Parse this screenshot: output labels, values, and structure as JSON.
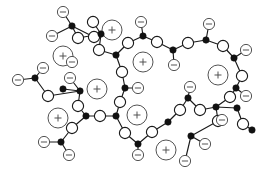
{
  "figure": {
    "canvas": {
      "width": 272,
      "height": 178,
      "background": "#ffffff"
    },
    "legend_semantics": {
      "junction": "filled black dot - crosslink / branch junction",
      "segment": "open white circle - polymer chain segment bead",
      "anion": "small circle with minus sign - pendant anionic group",
      "cation": "large circle with plus sign - free cationic counter-ion"
    },
    "colors": {
      "line": "#1a1a1a",
      "junction_fill": "#111111",
      "segment_fill": "#ffffff",
      "ion_stroke": "#4a4a4a",
      "background": "#ffffff"
    },
    "glyphs": {
      "anion_label": "−",
      "cation_label": "+"
    },
    "radii": {
      "junction": 3.2,
      "segment": 5.6,
      "anion": 5.6,
      "cation": 10.0
    }
  },
  "network_data": {
    "type": "node-link-diagram",
    "junctions": [
      {
        "id": "j1",
        "x": 72,
        "y": 26
      },
      {
        "id": "j2",
        "x": 101,
        "y": 34
      },
      {
        "id": "j3",
        "x": 116,
        "y": 55
      },
      {
        "id": "j4",
        "x": 143,
        "y": 36
      },
      {
        "id": "j5",
        "x": 173,
        "y": 50
      },
      {
        "id": "j6",
        "x": 206,
        "y": 40
      },
      {
        "id": "j7",
        "x": 234,
        "y": 58
      },
      {
        "id": "j8",
        "x": 236,
        "y": 88
      },
      {
        "id": "j9",
        "x": 237,
        "y": 108
      },
      {
        "id": "j10",
        "x": 216,
        "y": 107
      },
      {
        "id": "j11",
        "x": 188,
        "y": 98
      },
      {
        "id": "j12",
        "x": 168,
        "y": 122
      },
      {
        "id": "j13",
        "x": 191,
        "y": 136
      },
      {
        "id": "j14",
        "x": 138,
        "y": 144
      },
      {
        "id": "j15",
        "x": 116,
        "y": 116
      },
      {
        "id": "j16",
        "x": 86,
        "y": 116
      },
      {
        "id": "j17",
        "x": 125,
        "y": 88
      },
      {
        "id": "j18",
        "x": 80,
        "y": 91
      },
      {
        "id": "j19",
        "x": 63,
        "y": 89
      },
      {
        "id": "j20",
        "x": 61,
        "y": 142
      },
      {
        "id": "j21",
        "x": 35,
        "y": 78
      },
      {
        "id": "j22",
        "x": 252,
        "y": 130
      }
    ],
    "segments": [
      {
        "id": "s1",
        "x": 78,
        "y": 38
      },
      {
        "id": "s2",
        "x": 94,
        "y": 37
      },
      {
        "id": "s3",
        "x": 93,
        "y": 22
      },
      {
        "id": "s4",
        "x": 99,
        "y": 50
      },
      {
        "id": "s5",
        "x": 128,
        "y": 43
      },
      {
        "id": "s6",
        "x": 157,
        "y": 42
      },
      {
        "id": "s7",
        "x": 188,
        "y": 43
      },
      {
        "id": "s8",
        "x": 223,
        "y": 46
      },
      {
        "id": "s9",
        "x": 242,
        "y": 76
      },
      {
        "id": "s10",
        "x": 230,
        "y": 97
      },
      {
        "id": "s11",
        "x": 218,
        "y": 121
      },
      {
        "id": "s12",
        "x": 200,
        "y": 110
      },
      {
        "id": "s13",
        "x": 180,
        "y": 110
      },
      {
        "id": "s14",
        "x": 152,
        "y": 132
      },
      {
        "id": "s15",
        "x": 125,
        "y": 133
      },
      {
        "id": "s16",
        "x": 120,
        "y": 102
      },
      {
        "id": "s17",
        "x": 100,
        "y": 116
      },
      {
        "id": "s18",
        "x": 122,
        "y": 72
      },
      {
        "id": "s19",
        "x": 78,
        "y": 106
      },
      {
        "id": "s20",
        "x": 72,
        "y": 128
      },
      {
        "id": "s21",
        "x": 48,
        "y": 96
      },
      {
        "id": "s22",
        "x": 243,
        "y": 124
      }
    ],
    "anions": [
      {
        "id": "a1",
        "x": 63,
        "y": 12
      },
      {
        "id": "a2",
        "x": 52,
        "y": 36
      },
      {
        "id": "a3",
        "x": 141,
        "y": 22
      },
      {
        "id": "a4",
        "x": 174,
        "y": 65
      },
      {
        "id": "a5",
        "x": 209,
        "y": 24
      },
      {
        "id": "a6",
        "x": 246,
        "y": 50
      },
      {
        "id": "a7",
        "x": 246,
        "y": 96
      },
      {
        "id": "a8",
        "x": 222,
        "y": 120
      },
      {
        "id": "a9",
        "x": 190,
        "y": 87
      },
      {
        "id": "a10",
        "x": 138,
        "y": 155
      },
      {
        "id": "a11",
        "x": 205,
        "y": 144
      },
      {
        "id": "a12",
        "x": 185,
        "y": 161
      },
      {
        "id": "a13",
        "x": 138,
        "y": 88
      },
      {
        "id": "a14",
        "x": 70,
        "y": 78
      },
      {
        "id": "a15",
        "x": 43,
        "y": 68
      },
      {
        "id": "a16",
        "x": 18,
        "y": 80
      },
      {
        "id": "a17",
        "x": 44,
        "y": 142
      },
      {
        "id": "a18",
        "x": 69,
        "y": 155
      },
      {
        "id": "a19",
        "x": 72,
        "y": 62
      }
    ],
    "cations": [
      {
        "id": "c1",
        "x": 112,
        "y": 30
      },
      {
        "id": "c2",
        "x": 63,
        "y": 56
      },
      {
        "id": "c3",
        "x": 143,
        "y": 62
      },
      {
        "id": "c4",
        "x": 218,
        "y": 75
      },
      {
        "id": "c5",
        "x": 97,
        "y": 89
      },
      {
        "id": "c6",
        "x": 58,
        "y": 118
      },
      {
        "id": "c7",
        "x": 137,
        "y": 115
      },
      {
        "id": "c8",
        "x": 166,
        "y": 150
      }
    ],
    "bonds": [
      [
        "a1",
        "j1"
      ],
      [
        "j1",
        "a2"
      ],
      [
        "j1",
        "s1"
      ],
      [
        "s1",
        "j2"
      ],
      [
        "j2",
        "s3"
      ],
      [
        "j2",
        "s4"
      ],
      [
        "s4",
        "j3"
      ],
      [
        "j3",
        "s18"
      ],
      [
        "s18",
        "j17"
      ],
      [
        "j17",
        "a13"
      ],
      [
        "j17",
        "s16"
      ],
      [
        "s16",
        "j15"
      ],
      [
        "j15",
        "s17"
      ],
      [
        "s17",
        "j16"
      ],
      [
        "j16",
        "s19"
      ],
      [
        "s19",
        "j18"
      ],
      [
        "j18",
        "a14"
      ],
      [
        "j18",
        "s21"
      ],
      [
        "s21",
        "j21"
      ],
      [
        "j21",
        "a15"
      ],
      [
        "j21",
        "a16"
      ],
      [
        "j16",
        "s20"
      ],
      [
        "s20",
        "j20"
      ],
      [
        "j20",
        "a17"
      ],
      [
        "j20",
        "a18"
      ],
      [
        "j15",
        "s15"
      ],
      [
        "s15",
        "j14"
      ],
      [
        "j14",
        "a10"
      ],
      [
        "j14",
        "s14"
      ],
      [
        "s14",
        "j12"
      ],
      [
        "j12",
        "s13"
      ],
      [
        "s13",
        "j11"
      ],
      [
        "j11",
        "a9"
      ],
      [
        "j11",
        "s12"
      ],
      [
        "s12",
        "j10"
      ],
      [
        "j10",
        "s11"
      ],
      [
        "s11",
        "j13"
      ],
      [
        "j13",
        "a11"
      ],
      [
        "j13",
        "a12"
      ],
      [
        "j10",
        "s10"
      ],
      [
        "s10",
        "j8"
      ],
      [
        "j8",
        "a7"
      ],
      [
        "j8",
        "s9"
      ],
      [
        "s9",
        "j7"
      ],
      [
        "j7",
        "a6"
      ],
      [
        "j7",
        "s8"
      ],
      [
        "s8",
        "j6"
      ],
      [
        "j6",
        "a5"
      ],
      [
        "j6",
        "s7"
      ],
      [
        "s7",
        "j5"
      ],
      [
        "j5",
        "a4"
      ],
      [
        "j5",
        "s6"
      ],
      [
        "s6",
        "j4"
      ],
      [
        "j4",
        "a3"
      ],
      [
        "j4",
        "s5"
      ],
      [
        "s5",
        "j3"
      ],
      [
        "j9",
        "s22"
      ],
      [
        "s22",
        "j22"
      ],
      [
        "j9",
        "j10"
      ],
      [
        "j2",
        "s2"
      ],
      [
        "s2",
        "j1"
      ],
      [
        "j19",
        "j18"
      ]
    ],
    "counts": {
      "junctions": 22,
      "segments": 22,
      "anions": 19,
      "cations": 8,
      "bonds": 62
    }
  }
}
